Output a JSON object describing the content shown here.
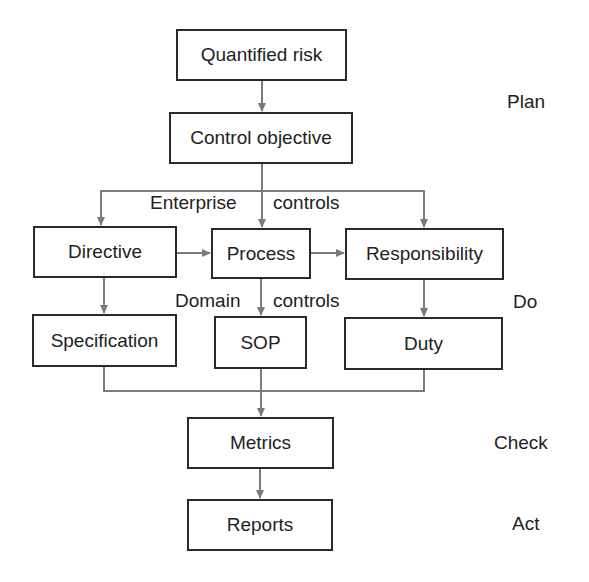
{
  "diagram": {
    "boxes": {
      "quantified_risk": "Quantified risk",
      "control_objective": "Control objective",
      "directive": "Directive",
      "process": "Process",
      "responsibility": "Responsibility",
      "specification": "Specification",
      "sop": "SOP",
      "duty": "Duty",
      "metrics": "Metrics",
      "reports": "Reports"
    },
    "edge_labels": {
      "enterprise_left": "Enterprise",
      "enterprise_right": "controls",
      "domain_left": "Domain",
      "domain_right": "controls"
    },
    "phases": {
      "plan": "Plan",
      "do": "Do",
      "check": "Check",
      "act": "Act"
    },
    "colors": {
      "box_border": "#2a2a2a",
      "connector": "#7a7a7a",
      "text": "#222222"
    }
  }
}
